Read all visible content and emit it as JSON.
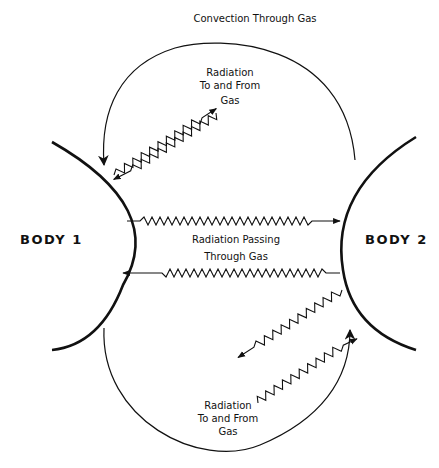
{
  "diagram": {
    "title": "Convection Through Gas",
    "bodies": [
      {
        "id": "body1",
        "label": "BODY  1"
      },
      {
        "id": "body2",
        "label": "BODY 2"
      }
    ],
    "labels": {
      "top_radiation_line1": "Radiation",
      "top_radiation_line2": "To  and From",
      "top_radiation_line3": "Gas",
      "middle_line1": "Radiation Passing",
      "middle_line2": "Through  Gas",
      "bottom_radiation_line1": "Radiation",
      "bottom_radiation_line2": "To  and From",
      "bottom_radiation_line3": "Gas"
    },
    "arrows": [
      {
        "name": "convection-upper",
        "from": "body2",
        "to": "body1",
        "type": "curved-arc"
      },
      {
        "name": "convection-lower",
        "from": "body1",
        "to": "body2",
        "type": "curved-arc"
      },
      {
        "name": "radiation-body1-to-body2",
        "type": "wavy"
      },
      {
        "name": "radiation-body2-to-body1",
        "type": "wavy"
      },
      {
        "name": "radiation-body1-gas-emit",
        "type": "wavy"
      },
      {
        "name": "radiation-gas-to-body1",
        "type": "wavy"
      },
      {
        "name": "radiation-body2-gas-emit",
        "type": "wavy"
      },
      {
        "name": "radiation-gas-to-body2",
        "type": "wavy"
      }
    ]
  }
}
